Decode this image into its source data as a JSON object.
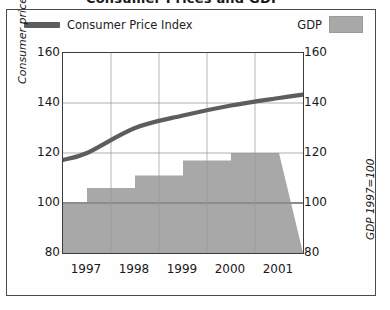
{
  "title": "Consumer Prices and GDP",
  "legend": {
    "cpi_label": "Consumer Price Index",
    "gdp_label": "GDP",
    "cpi_color": "#5d5d5d",
    "gdp_color": "#a8a8a8"
  },
  "axes": {
    "left_title": "Consumer price index 1995=100",
    "right_title": "GDP 1997=100",
    "yticks": [
      "160",
      "140",
      "120",
      "100",
      "80"
    ],
    "xticks": [
      "1997",
      "1998",
      "1999",
      "2000",
      "2001"
    ]
  },
  "chart_data": {
    "type": "line",
    "title": "Consumer Prices and GDP",
    "xlabel": "",
    "ylabel": "Consumer price index 1995=100",
    "y2label": "GDP 1997=100",
    "categories": [
      "1997",
      "1998",
      "1999",
      "2000",
      "2001"
    ],
    "ylim": [
      80,
      160
    ],
    "y2lim": [
      80,
      160
    ],
    "yticks": [
      80,
      100,
      120,
      140,
      160
    ],
    "grid": true,
    "legend_position": "top",
    "series": [
      {
        "name": "Consumer Price Index",
        "type": "line",
        "axis": "left",
        "color": "#5d5d5d",
        "x": [
          "1997",
          "1998",
          "1999",
          "2000",
          "2001"
        ],
        "values": [
          120,
          130,
          135,
          139,
          142
        ]
      },
      {
        "name": "GDP",
        "type": "bar",
        "axis": "right",
        "color": "#a8a8a8",
        "x": [
          "1997",
          "1998",
          "1999",
          "2000",
          "2001"
        ],
        "values": [
          100,
          106,
          111,
          117,
          120
        ]
      }
    ]
  }
}
